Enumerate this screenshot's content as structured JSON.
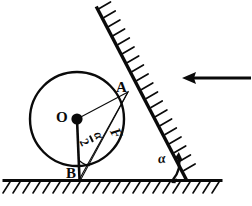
{
  "figure": {
    "labels": {
      "center": "O",
      "contact_wall": "A",
      "contact_ground": "B",
      "force": "F",
      "angle_wall": "α",
      "half_angle_numerator": "α",
      "half_angle_denominator": "2"
    },
    "icons": {
      "applied_force_arrow": "left-arrow-icon",
      "center_point": "center-dot-icon",
      "angle_arc_at_b": "angle-arc-icon",
      "angle_arc_at_wall": "angle-arc-arrow-icon",
      "wall_hatching": "hatch-icon",
      "ground_hatching": "hatch-icon"
    },
    "geometry": {
      "circle": {
        "cx": 77,
        "cy": 119,
        "r": 47
      },
      "point_A": {
        "x": 128,
        "y": 92
      },
      "point_B": {
        "x": 80,
        "y": 179
      },
      "ground_line_y": 180,
      "wall_top": {
        "x": 97,
        "y": 8
      },
      "wall_bottom": {
        "x": 185,
        "y": 178
      },
      "arrow": {
        "x1": 249,
        "y1": 78,
        "x2": 183,
        "y2": 78
      }
    },
    "colors": {
      "ink": "#0a0a0a",
      "background": "#ffffff"
    }
  }
}
